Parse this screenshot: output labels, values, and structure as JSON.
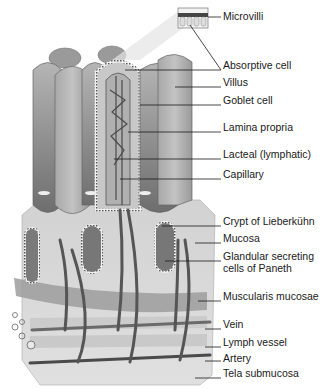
{
  "diagram": {
    "colors": {
      "background": "#ffffff",
      "villus_dark": "#7e7e7e",
      "villus_light": "#b4b4b4",
      "mucosa": "#cfcfcf",
      "muscularis": "#9a9a9a",
      "submucosa": "#dadada",
      "vessel": "#5a5a5a",
      "leader_line": "#1a1a1a"
    },
    "labels": [
      {
        "id": "microvilli",
        "text": "Microvilli",
        "y": 17
      },
      {
        "id": "absorptive-cell",
        "text": "Absorptive cell",
        "y": 66
      },
      {
        "id": "villus",
        "text": "Villus",
        "y": 83
      },
      {
        "id": "goblet-cell",
        "text": "Goblet cell",
        "y": 101
      },
      {
        "id": "lamina-propria",
        "text": "Lamina propria",
        "y": 128
      },
      {
        "id": "lacteal",
        "text": "Lacteal (lymphatic)",
        "y": 155
      },
      {
        "id": "capillary",
        "text": "Capillary",
        "y": 175
      },
      {
        "id": "crypt-of-lieberkuhn",
        "text": "Crypt of Lieberkühn",
        "y": 222
      },
      {
        "id": "mucosa",
        "text": "Mucosa",
        "y": 239
      },
      {
        "id": "glandular-cells",
        "text": "Glandular secreting",
        "y": 257
      },
      {
        "id": "glandular-cells-2",
        "text": "cells of Paneth",
        "y": 269
      },
      {
        "id": "muscularis-mucosae",
        "text": "Muscularis mucosae",
        "y": 297
      },
      {
        "id": "vein",
        "text": "Vein",
        "y": 325
      },
      {
        "id": "lymph-vessel",
        "text": "Lymph vessel",
        "y": 343
      },
      {
        "id": "artery",
        "text": "Artery",
        "y": 359
      },
      {
        "id": "tela-submucosa",
        "text": "Tela submucosa",
        "y": 374
      }
    ]
  }
}
